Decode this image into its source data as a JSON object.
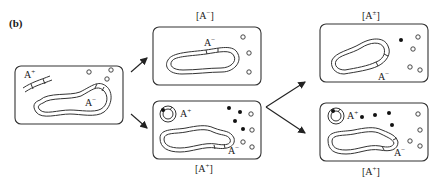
{
  "figure": {
    "panel_label": "(b)"
  },
  "cells": {
    "start": {
      "plasmid_label": "A",
      "plasmid_sup": "+",
      "chromosome_label": "A",
      "chromosome_sup": "−"
    },
    "top_middle": {
      "title_open": "[A",
      "title_sup": "−",
      "title_close": "]",
      "chromosome_label": "A",
      "chromosome_sup": "−"
    },
    "bottom_middle": {
      "title_open": "[A",
      "title_sup": "+",
      "title_close": "]",
      "plasmid_label": "A",
      "plasmid_sup": "+",
      "chromosome_label": "A",
      "chromosome_sup": "−"
    },
    "top_right": {
      "title_open": "[A",
      "title_sup": "±",
      "title_close": "]",
      "chromosome_label": "A",
      "chromosome_sup": "−"
    },
    "bottom_right": {
      "title_open": "[A",
      "title_sup": "+",
      "title_close": "]",
      "plasmid_label": "A",
      "plasmid_sup": "+",
      "chromosome_label": "A",
      "chromosome_sup": "−"
    }
  },
  "legend": {
    "open_circle": "mitochondrion-without-plasmid-product",
    "filled_circle": "plasmid-product"
  }
}
